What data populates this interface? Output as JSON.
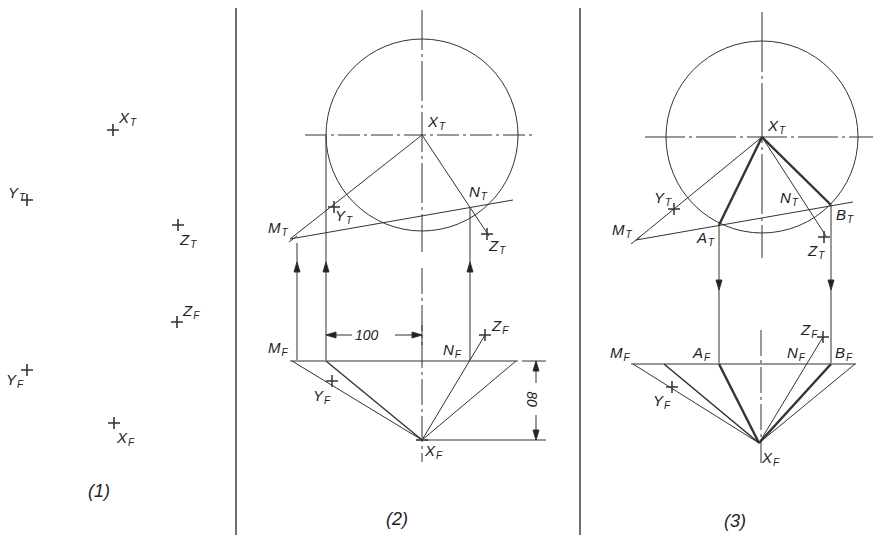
{
  "figure": {
    "panels": [
      {
        "caption": "(1)"
      },
      {
        "caption": "(2)"
      },
      {
        "caption": "(3)"
      }
    ],
    "panel1": {
      "points": [
        {
          "name": "X",
          "sub": "T"
        },
        {
          "name": "Y",
          "sub": "T"
        },
        {
          "name": "Z",
          "sub": "T"
        },
        {
          "name": "Z",
          "sub": "F"
        },
        {
          "name": "Y",
          "sub": "F"
        },
        {
          "name": "X",
          "sub": "F"
        }
      ]
    },
    "panel2": {
      "labels": {
        "xt": {
          "name": "X",
          "sub": "T"
        },
        "nt": {
          "name": "N",
          "sub": "T"
        },
        "mt": {
          "name": "M",
          "sub": "T"
        },
        "yt": {
          "name": "Y",
          "sub": "T"
        },
        "zt": {
          "name": "Z",
          "sub": "T"
        },
        "zf": {
          "name": "Z",
          "sub": "F"
        },
        "mf": {
          "name": "M",
          "sub": "F"
        },
        "nf": {
          "name": "N",
          "sub": "F"
        },
        "yf": {
          "name": "Y",
          "sub": "F"
        },
        "xf": {
          "name": "X",
          "sub": "F"
        }
      },
      "dimensions": {
        "horizontal": "100",
        "vertical": "80"
      }
    },
    "panel3": {
      "labels": {
        "xt": {
          "name": "X",
          "sub": "T"
        },
        "yt": {
          "name": "Y",
          "sub": "T"
        },
        "nt": {
          "name": "N",
          "sub": "T"
        },
        "bt": {
          "name": "B",
          "sub": "T"
        },
        "mt": {
          "name": "M",
          "sub": "T"
        },
        "at": {
          "name": "A",
          "sub": "T"
        },
        "zt": {
          "name": "Z",
          "sub": "T"
        },
        "zf": {
          "name": "Z",
          "sub": "F"
        },
        "mf": {
          "name": "M",
          "sub": "F"
        },
        "af": {
          "name": "A",
          "sub": "F"
        },
        "nf": {
          "name": "N",
          "sub": "F"
        },
        "bf": {
          "name": "B",
          "sub": "F"
        },
        "yf": {
          "name": "Y",
          "sub": "F"
        },
        "xf": {
          "name": "X",
          "sub": "F"
        }
      }
    }
  }
}
